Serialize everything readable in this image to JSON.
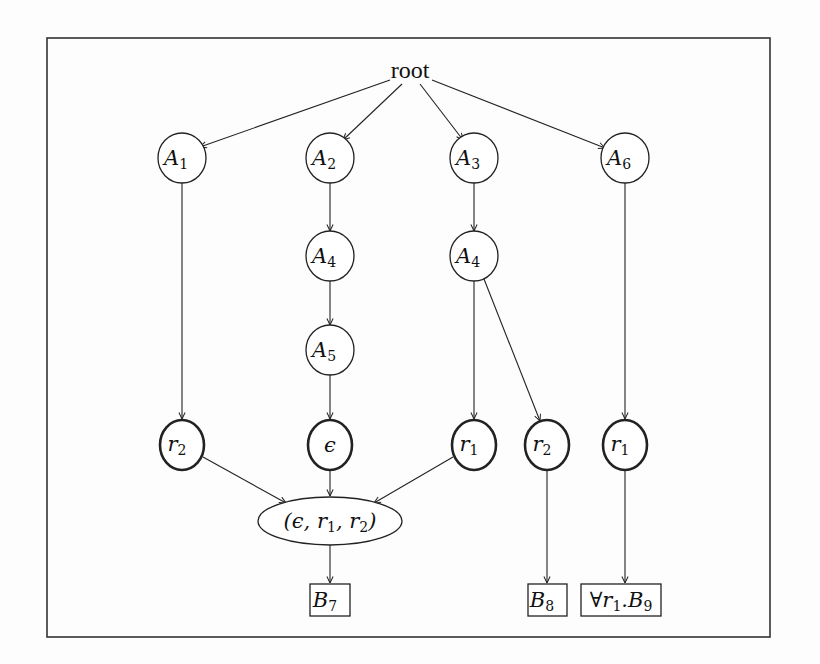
{
  "diagram": {
    "type": "tree",
    "root": {
      "id": "root",
      "label": "root"
    },
    "nodes": [
      {
        "id": "A1",
        "base": "A",
        "sub": "1",
        "shape": "circle",
        "style": "thin"
      },
      {
        "id": "A2",
        "base": "A",
        "sub": "2",
        "shape": "circle",
        "style": "thin"
      },
      {
        "id": "A3",
        "base": "A",
        "sub": "3",
        "shape": "circle",
        "style": "thin"
      },
      {
        "id": "A6",
        "base": "A",
        "sub": "6",
        "shape": "circle",
        "style": "thin"
      },
      {
        "id": "A4a",
        "base": "A",
        "sub": "4",
        "shape": "circle",
        "style": "thin"
      },
      {
        "id": "A4b",
        "base": "A",
        "sub": "4",
        "shape": "circle",
        "style": "thin"
      },
      {
        "id": "A5",
        "base": "A",
        "sub": "5",
        "shape": "circle",
        "style": "thin"
      },
      {
        "id": "r2a",
        "base": "r",
        "sub": "2",
        "shape": "circle",
        "style": "thick"
      },
      {
        "id": "eps",
        "base": "ε",
        "sub": "",
        "shape": "circle",
        "style": "thick"
      },
      {
        "id": "r1a",
        "base": "r",
        "sub": "1",
        "shape": "circle",
        "style": "thick"
      },
      {
        "id": "r2b",
        "base": "r",
        "sub": "2",
        "shape": "circle",
        "style": "thick"
      },
      {
        "id": "r1b",
        "base": "r",
        "sub": "1",
        "shape": "circle",
        "style": "thick"
      },
      {
        "id": "tuple",
        "label": "(ε, r1, r2)",
        "shape": "ellipse"
      },
      {
        "id": "B7",
        "base": "B",
        "sub": "7",
        "shape": "box"
      },
      {
        "id": "B8",
        "base": "B",
        "sub": "8",
        "shape": "box"
      },
      {
        "id": "B9",
        "prefix": "∀r",
        "prefix_sub": "1",
        "base": ".B",
        "sub": "9",
        "shape": "box"
      }
    ],
    "edges": [
      [
        "root",
        "A1"
      ],
      [
        "root",
        "A2"
      ],
      [
        "root",
        "A3"
      ],
      [
        "root",
        "A6"
      ],
      [
        "A1",
        "r2a"
      ],
      [
        "A2",
        "A4a"
      ],
      [
        "A4a",
        "A5"
      ],
      [
        "A5",
        "eps"
      ],
      [
        "A3",
        "A4b"
      ],
      [
        "A4b",
        "r1a"
      ],
      [
        "A4b",
        "r2b"
      ],
      [
        "A6",
        "r1b"
      ],
      [
        "r2a",
        "tuple"
      ],
      [
        "eps",
        "tuple"
      ],
      [
        "r1a",
        "tuple"
      ],
      [
        "tuple",
        "B7"
      ],
      [
        "r2b",
        "B8"
      ],
      [
        "r1b",
        "B9"
      ]
    ],
    "labels": {
      "root": "root",
      "A1": "A",
      "A1s": "1",
      "A2": "A",
      "A2s": "2",
      "A3": "A",
      "A3s": "3",
      "A6": "A",
      "A6s": "6",
      "A4a": "A",
      "A4as": "4",
      "A4b": "A",
      "A4bs": "4",
      "A5": "A",
      "A5s": "5",
      "r2a": "r",
      "r2as": "2",
      "eps": "ϵ",
      "r1a": "r",
      "r1as": "1",
      "r2b": "r",
      "r2bs": "2",
      "r1b": "r",
      "r1bs": "1",
      "tuple_open": "(ϵ, r",
      "tuple_s1": "1",
      "tuple_mid": ", r",
      "tuple_s2": "2",
      "tuple_close": ")",
      "B7": "B",
      "B7s": "7",
      "B8": "B",
      "B8s": "8",
      "B9_pre": "∀r",
      "B9_pres": "1",
      "B9": ".B",
      "B9s": "9"
    },
    "colors": {
      "stroke": "#222222",
      "background": "#fdfdfd"
    }
  }
}
